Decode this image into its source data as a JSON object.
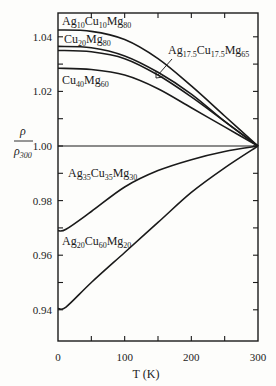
{
  "chart_data": {
    "type": "line",
    "title": "",
    "xlabel": "T (K)",
    "ylabel": "ρ / ρ300",
    "xlim": [
      0,
      300
    ],
    "ylim": [
      0.93,
      1.05
    ],
    "grid": false,
    "legend": "inline labels",
    "x_ticks": [
      0,
      100,
      200,
      300
    ],
    "x_minor_ticks": [
      50,
      150,
      250
    ],
    "y_ticks": [
      0.94,
      0.96,
      0.98,
      1.0,
      1.02,
      1.04
    ],
    "y_minor_ticks": [
      0.95,
      0.97,
      0.99,
      1.01,
      1.03
    ],
    "reference_line": {
      "y": 1.0,
      "label": ""
    },
    "x": [
      0,
      50,
      100,
      150,
      200,
      250,
      300
    ],
    "series": [
      {
        "name": "Ag10Cu10Mg80",
        "label_main": [
          "Ag",
          "Cu",
          "Mg"
        ],
        "label_sub": [
          "10",
          "10",
          "80"
        ],
        "values": [
          1.0425,
          1.042,
          1.039,
          1.032,
          1.022,
          1.011,
          1.0
        ]
      },
      {
        "name": "Cu20Mg80",
        "label_main": [
          "Cu",
          "Mg"
        ],
        "label_sub": [
          "20",
          "80"
        ],
        "values": [
          1.0365,
          1.036,
          1.033,
          1.027,
          1.019,
          1.009,
          1.0
        ]
      },
      {
        "name": "Ag17.5Cu17.5Mg65",
        "label_main": [
          "Ag",
          "Cu",
          "Mg"
        ],
        "label_sub": [
          "17.5",
          "17.5",
          "65"
        ],
        "values": [
          1.035,
          1.0345,
          1.032,
          1.026,
          1.018,
          1.009,
          1.0
        ]
      },
      {
        "name": "Cu40Mg60",
        "label_main": [
          "Cu",
          "Mg"
        ],
        "label_sub": [
          "40",
          "60"
        ],
        "values": [
          1.0285,
          1.028,
          1.026,
          1.021,
          1.014,
          1.007,
          1.0
        ]
      },
      {
        "name": "Ag35Cu35Mg30",
        "label_main": [
          "Ag",
          "Cu",
          "Mg"
        ],
        "label_sub": [
          "35",
          "35",
          "30"
        ],
        "values": [
          0.969,
          0.976,
          0.985,
          0.991,
          0.995,
          0.998,
          1.0
        ]
      },
      {
        "name": "Ag20Cu60Mg20",
        "label_main": [
          "Ag",
          "Cu",
          "Mg"
        ],
        "label_sub": [
          "20",
          "60",
          "20"
        ],
        "values": [
          0.9405,
          0.95,
          0.961,
          0.972,
          0.983,
          0.992,
          1.0
        ]
      }
    ]
  },
  "labels": {
    "x_tick_labels": [
      "0",
      "100",
      "200",
      "300"
    ],
    "y_tick_labels": [
      "0.94",
      "0.96",
      "0.98",
      "1.00",
      "1.02",
      "1.04"
    ],
    "xlabel": "T (K)",
    "ylabel_num": "ρ",
    "ylabel_den_main": "ρ",
    "ylabel_den_sub": "300"
  }
}
